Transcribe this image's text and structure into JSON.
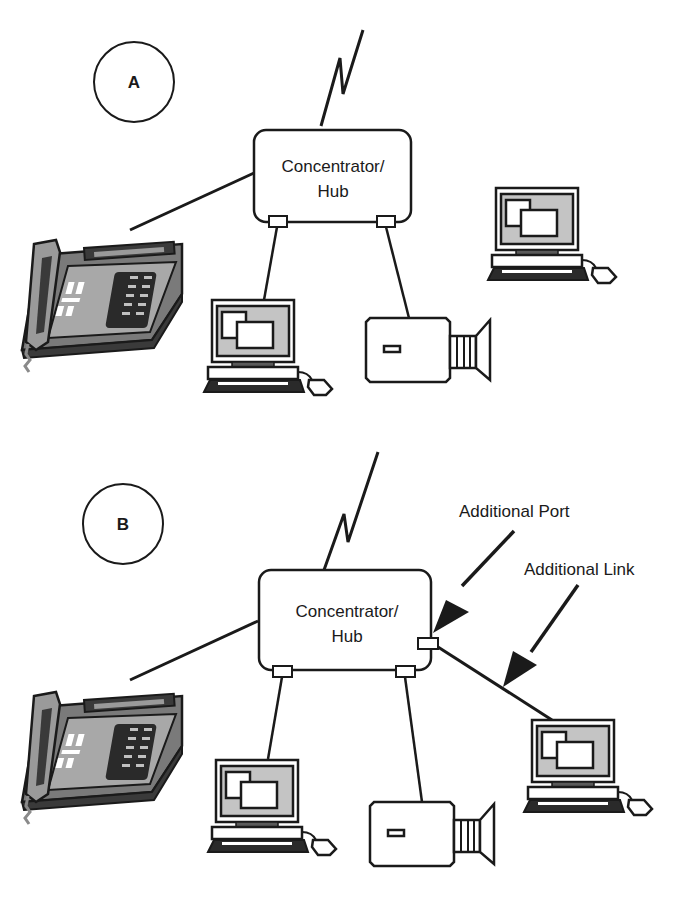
{
  "diagram": {
    "type": "network-topology",
    "colors": {
      "stroke": "#1a1a1a",
      "screen_fill": "#c4c4c4",
      "phone_body": "#7a7a7a",
      "phone_dark": "#3a3a3a",
      "keyboard": "#2a2a2a",
      "background": "#ffffff"
    },
    "panels": [
      {
        "id": "A",
        "label": "A",
        "hub": {
          "line1": "Concentrator/",
          "line2": "Hub",
          "ports": 2
        },
        "devices": [
          "telephone",
          "computer",
          "video-camera"
        ],
        "unconnected_devices": [
          "computer"
        ],
        "links": [
          {
            "from": "hub",
            "to": "telephone"
          },
          {
            "from": "hub-port-1",
            "to": "computer"
          },
          {
            "from": "hub-port-2",
            "to": "video-camera"
          },
          {
            "from": "hub",
            "to": "wan-link"
          }
        ]
      },
      {
        "id": "B",
        "label": "B",
        "hub": {
          "line1": "Concentrator/",
          "line2": "Hub",
          "ports": 3
        },
        "devices": [
          "telephone",
          "computer",
          "video-camera",
          "computer"
        ],
        "links": [
          {
            "from": "hub",
            "to": "telephone"
          },
          {
            "from": "hub-port-1",
            "to": "computer"
          },
          {
            "from": "hub-port-2",
            "to": "video-camera"
          },
          {
            "from": "hub-port-3",
            "to": "computer"
          },
          {
            "from": "hub",
            "to": "wan-link"
          }
        ],
        "callouts": {
          "port": "Additional Port",
          "link": "Additional Link"
        }
      }
    ]
  }
}
